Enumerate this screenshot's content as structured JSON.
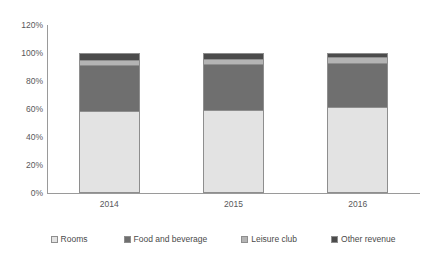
{
  "chart_data": {
    "type": "bar",
    "subtype": "100% stacked column",
    "title": "",
    "subtitle": "",
    "xlabel": "",
    "ylabel": "",
    "categories": [
      "2014",
      "2015",
      "2016"
    ],
    "series": [
      {
        "name": "Rooms",
        "values": [
          58,
          59,
          61
        ],
        "color": "#e3e3e3"
      },
      {
        "name": "Food and beverage",
        "values": [
          33,
          33,
          32
        ],
        "color": "#6f6f6f"
      },
      {
        "name": "Leisure club",
        "values": [
          4,
          4,
          4
        ],
        "color": "#b4b4b4"
      },
      {
        "name": "Other revenue",
        "values": [
          5,
          4,
          3
        ],
        "color": "#4b4b4b"
      }
    ],
    "ylim": [
      0,
      120
    ],
    "ytick_values": [
      0,
      20,
      40,
      60,
      80,
      100,
      120
    ],
    "ytick_labels": [
      "0%",
      "20%",
      "40%",
      "60%",
      "80%",
      "100%",
      "120%"
    ],
    "grid": false,
    "legend_position": "bottom",
    "stacked": true
  },
  "axes": {
    "y_ticks": [
      {
        "label": "120%",
        "value": 120
      },
      {
        "label": "100%",
        "value": 100
      },
      {
        "label": "80%",
        "value": 80
      },
      {
        "label": "60%",
        "value": 60
      },
      {
        "label": "40%",
        "value": 40
      },
      {
        "label": "20%",
        "value": 20
      },
      {
        "label": "0%",
        "value": 0
      }
    ],
    "x_labels": [
      "2014",
      "2015",
      "2016"
    ]
  },
  "legend": {
    "items": [
      {
        "label": "Rooms",
        "color": "#e3e3e3"
      },
      {
        "label": "Food and beverage",
        "color": "#6f6f6f"
      },
      {
        "label": "Leisure club",
        "color": "#b4b4b4"
      },
      {
        "label": "Other revenue",
        "color": "#4b4b4b"
      }
    ]
  }
}
